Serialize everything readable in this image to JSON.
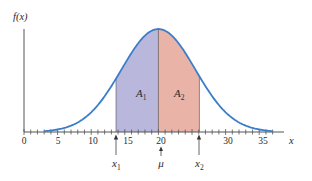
{
  "chart_data": {
    "type": "area",
    "title": "",
    "xlabel": "x",
    "ylabel": "f(x)",
    "xlim": [
      0,
      38
    ],
    "x_ticks": [
      0,
      5,
      10,
      15,
      20,
      30,
      35
    ],
    "x_tick_labels": [
      "0",
      "5",
      "10",
      "15",
      "20",
      "30",
      "35"
    ],
    "minor_tick_step": 1,
    "grid": false,
    "distribution": "normal",
    "mean": 20,
    "std_dev": 5.5,
    "curve_x_range": [
      3,
      37
    ],
    "regions": [
      {
        "name": "A1",
        "label_main": "A",
        "label_sub": "1",
        "from": 13.7,
        "to": 20,
        "color": "#b9b8dc"
      },
      {
        "name": "A2",
        "label_main": "A",
        "label_sub": "2",
        "from": 20,
        "to": 26.1,
        "color": "#eab3a8"
      }
    ],
    "annotations": [
      {
        "text_main": "x",
        "text_sub": "1",
        "x": 13.7,
        "arrow": true
      },
      {
        "text_main": "μ",
        "text_sub": "",
        "x": 20,
        "arrow": true
      },
      {
        "text_main": "x",
        "text_sub": "2",
        "x": 26.1,
        "arrow": true
      }
    ],
    "curve_color": "#3a7dc9",
    "axis_color": "#555555"
  },
  "labels": {
    "y_axis": "f(x)",
    "x_axis": "x",
    "tick0": "0",
    "tick5": "5",
    "tick10": "10",
    "tick15": "15",
    "tick20": "20",
    "tick30": "30",
    "tick35": "35",
    "a1_main": "A",
    "a1_sub": "1",
    "a2_main": "A",
    "a2_sub": "2",
    "x1_main": "x",
    "x1_sub": "1",
    "mu": "μ",
    "x2_main": "x",
    "x2_sub": "2"
  }
}
